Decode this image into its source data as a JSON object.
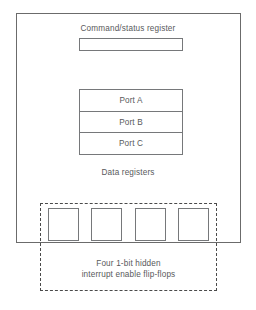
{
  "diagram": {
    "command_status": {
      "label": "Command/status register"
    },
    "data_registers": {
      "caption": "Data registers",
      "ports": [
        {
          "label": "Port A"
        },
        {
          "label": "Port B"
        },
        {
          "label": "Port C"
        }
      ]
    },
    "flip_flops": {
      "caption_line1": "Four 1-bit hidden",
      "caption_line2": "interrupt enable flip-flops",
      "count": 4,
      "cells": [
        {
          "label": ""
        },
        {
          "label": ""
        },
        {
          "label": ""
        },
        {
          "label": ""
        }
      ]
    },
    "colors": {
      "stroke": "#76787a",
      "outer_stroke": "#6b6b6b",
      "dashed_stroke": "#4a4a4a",
      "text": "#58595b",
      "background": "#ffffff"
    }
  }
}
